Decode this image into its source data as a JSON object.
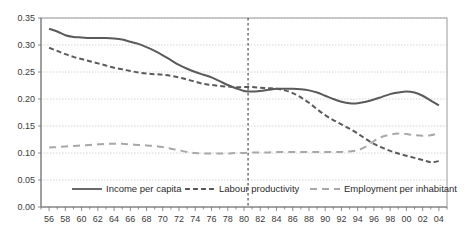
{
  "chart_data": {
    "type": "line",
    "title": "",
    "subtitle": "",
    "xlabel": "",
    "ylabel": "",
    "xlim": [
      1955,
      2005
    ],
    "ylim": [
      0.0,
      0.35
    ],
    "ytick_values": [
      0.0,
      0.05,
      0.1,
      0.15,
      0.2,
      0.25,
      0.3,
      0.35
    ],
    "ytick_labels": [
      "0.00",
      "0.05",
      "0.10",
      "0.15",
      "0.20",
      "0.25",
      "0.30",
      "0.35"
    ],
    "xtick_labels": [
      "56",
      "58",
      "60",
      "62",
      "64",
      "66",
      "68",
      "70",
      "72",
      "74",
      "76",
      "78",
      "80",
      "82",
      "84",
      "86",
      "88",
      "90",
      "92",
      "94",
      "96",
      "98",
      "00",
      "02",
      "04"
    ],
    "xtick_years": [
      1956,
      1958,
      1960,
      1962,
      1964,
      1966,
      1968,
      1970,
      1972,
      1974,
      1976,
      1978,
      1980,
      1982,
      1984,
      1986,
      1988,
      1990,
      1992,
      1994,
      1996,
      1998,
      2000,
      2002,
      2004
    ],
    "x_minor_years": [
      1955,
      1957,
      1959,
      1961,
      1963,
      1965,
      1967,
      1969,
      1971,
      1973,
      1975,
      1977,
      1979,
      1981,
      1983,
      1985,
      1987,
      1989,
      1991,
      1993,
      1995,
      1997,
      1999,
      2001,
      2003,
      2005
    ],
    "grid": "horizontal-dotted",
    "legend_position": "bottom-inside",
    "x": [
      1956,
      1957,
      1958,
      1959,
      1960,
      1961,
      1962,
      1963,
      1964,
      1965,
      1966,
      1967,
      1968,
      1969,
      1970,
      1971,
      1972,
      1973,
      1974,
      1975,
      1976,
      1977,
      1978,
      1979,
      1980,
      1981,
      1982,
      1983,
      1984,
      1985,
      1986,
      1987,
      1988,
      1989,
      1990,
      1991,
      1992,
      1993,
      1994,
      1995,
      1996,
      1997,
      1998,
      1999,
      2000,
      2001,
      2002,
      2003,
      2004
    ],
    "series": [
      {
        "name": "Income per capita",
        "style": "solid",
        "color": "#5a5a5a",
        "width": 2.0,
        "values": [
          0.33,
          0.325,
          0.318,
          0.315,
          0.314,
          0.313,
          0.313,
          0.313,
          0.312,
          0.31,
          0.306,
          0.302,
          0.296,
          0.289,
          0.281,
          0.272,
          0.263,
          0.256,
          0.25,
          0.245,
          0.24,
          0.233,
          0.226,
          0.22,
          0.215,
          0.214,
          0.215,
          0.217,
          0.219,
          0.219,
          0.219,
          0.218,
          0.216,
          0.212,
          0.206,
          0.2,
          0.195,
          0.192,
          0.192,
          0.195,
          0.199,
          0.204,
          0.209,
          0.212,
          0.214,
          0.212,
          0.206,
          0.197,
          0.188
        ]
      },
      {
        "name": "Labour productivity",
        "style": "dashed",
        "color": "#5a5a5a",
        "width": 2.0,
        "values": [
          0.295,
          0.289,
          0.283,
          0.278,
          0.274,
          0.27,
          0.266,
          0.262,
          0.258,
          0.255,
          0.252,
          0.249,
          0.247,
          0.246,
          0.245,
          0.243,
          0.24,
          0.236,
          0.232,
          0.228,
          0.226,
          0.224,
          0.223,
          0.222,
          0.222,
          0.222,
          0.221,
          0.22,
          0.219,
          0.216,
          0.211,
          0.203,
          0.193,
          0.181,
          0.17,
          0.161,
          0.153,
          0.145,
          0.136,
          0.126,
          0.117,
          0.11,
          0.104,
          0.099,
          0.095,
          0.091,
          0.087,
          0.083,
          0.085
        ]
      },
      {
        "name": "Employment per inhabitant",
        "style": "dashed-long",
        "color": "#a8a8a8",
        "width": 2.0,
        "values": [
          0.11,
          0.111,
          0.112,
          0.113,
          0.114,
          0.115,
          0.116,
          0.117,
          0.117,
          0.117,
          0.116,
          0.115,
          0.114,
          0.113,
          0.111,
          0.108,
          0.105,
          0.102,
          0.1,
          0.099,
          0.099,
          0.099,
          0.099,
          0.1,
          0.1,
          0.101,
          0.101,
          0.101,
          0.102,
          0.102,
          0.102,
          0.102,
          0.102,
          0.102,
          0.102,
          0.102,
          0.102,
          0.103,
          0.105,
          0.112,
          0.122,
          0.13,
          0.134,
          0.136,
          0.135,
          0.133,
          0.132,
          0.133,
          0.137
        ]
      }
    ],
    "annotations": [
      {
        "type": "vertical-line",
        "name": "year-1980-marker",
        "x": 1980.5,
        "style": "dashed",
        "color": "#2b2b2b"
      }
    ]
  },
  "legend": {
    "items": [
      {
        "label": "Income per capita",
        "style": "solid",
        "color": "#5a5a5a"
      },
      {
        "label": "Labour productivity",
        "style": "dashed",
        "color": "#5a5a5a"
      },
      {
        "label": "Employment per inhabitant",
        "style": "dashed-long",
        "color": "#a8a8a8"
      }
    ]
  },
  "colors": {
    "grid": "#c9c9c9",
    "frame": "#9a9a9a",
    "text": "#3a3a3a",
    "background": "#ffffff"
  }
}
